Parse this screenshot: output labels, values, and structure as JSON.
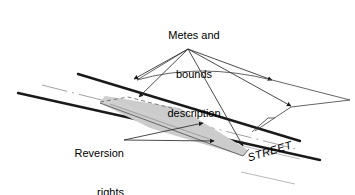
{
  "figure": {
    "background_color": "#ffffff",
    "line_color": "#1a1a1a",
    "thin_line_color": "#3c3c3c",
    "parcel_fill_color": "#cccccc",
    "parcel_stroke_color": "#555555",
    "dashed_stroke_color": "#777777"
  },
  "labels": {
    "metes": {
      "line1": "Metes and",
      "line2": "bounds",
      "line3": "description"
    },
    "reversion": {
      "line1": "Reversion",
      "line2": "rights"
    },
    "street": "STREET"
  },
  "annotations": {
    "metes_leader_origin": "188,49",
    "metes_arrow_targets": [
      "132,80",
      "137,98",
      "242,147",
      "271,80",
      "290,106"
    ],
    "reversion_leader_origin": "124,140",
    "reversion_arrow_targets": [
      "203,124",
      "213,140"
    ]
  },
  "geometry": {
    "road_upper_edge": "78,74 to 300,141",
    "road_lower_edge": "18,93 to 320,160",
    "road_centerline_dashed": "42,85 to 300,150",
    "parcel_vertices": "105,96 248,150 243,155 100,103",
    "street_label_rotation_deg": -17
  }
}
